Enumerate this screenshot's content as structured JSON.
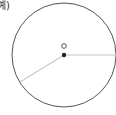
{
  "label": {
    "text": "예)"
  },
  "diagram": {
    "type": "circle-with-radii",
    "circle": {
      "cx": 64,
      "cy": 55,
      "r": 52,
      "stroke": "#555555"
    },
    "center_point": {
      "x": 64,
      "y": 55,
      "color": "#222222"
    },
    "center_label_marker": {
      "x": 64,
      "y": 46,
      "shape": "hollow-circle"
    },
    "radius_lines": [
      {
        "to_x": 116,
        "to_y": 55,
        "color": "#c8c8c8"
      },
      {
        "to_x": 20,
        "to_y": 82,
        "color": "#c8c8c8"
      }
    ]
  }
}
